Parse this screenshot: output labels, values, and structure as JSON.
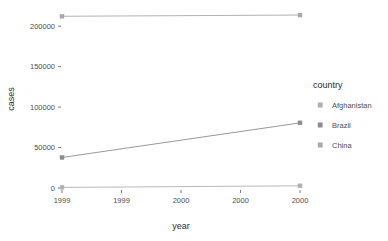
{
  "chart_data": {
    "type": "line",
    "title": "",
    "xlabel": "year",
    "ylabel": "cases",
    "x": [
      1999,
      2000
    ],
    "xlim": [
      1999,
      2000
    ],
    "ylim": [
      0,
      220000
    ],
    "xticks": [
      {
        "value": 1999.0,
        "label": "1999"
      },
      {
        "value": 1999.25,
        "label": "1999"
      },
      {
        "value": 1999.5,
        "label": "2000"
      },
      {
        "value": 1999.75,
        "label": "2000"
      },
      {
        "value": 2000.0,
        "label": "2000"
      }
    ],
    "yticks": [
      {
        "value": 0,
        "label": "0"
      },
      {
        "value": 50000,
        "label": "50000"
      },
      {
        "value": 100000,
        "label": "100000"
      },
      {
        "value": 150000,
        "label": "150000"
      },
      {
        "value": 200000,
        "label": "200000"
      }
    ],
    "grid": false,
    "legend": {
      "title": "country",
      "position": "right",
      "entries": [
        {
          "label": "Afghanistan",
          "color": "#b0b0b0"
        },
        {
          "label": "Brazil",
          "color": "#8c8c8c"
        },
        {
          "label": "China",
          "color": "#a8a8a8"
        }
      ]
    },
    "series": [
      {
        "name": "Afghanistan",
        "color": "#b0b0b0",
        "values": [
          745,
          2666
        ]
      },
      {
        "name": "Brazil",
        "color": "#8c8c8c",
        "values": [
          37737,
          80488
        ]
      },
      {
        "name": "China",
        "color": "#a8a8a8",
        "values": [
          212258,
          213766
        ]
      }
    ]
  }
}
